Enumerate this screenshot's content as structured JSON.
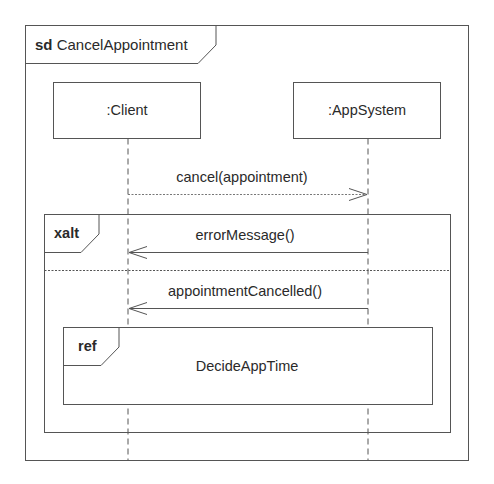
{
  "diagram": {
    "type": "UML sequence diagram",
    "frame": {
      "keyword": "sd",
      "name": "CancelAppointment"
    },
    "lifelines": [
      {
        "label": ":Client"
      },
      {
        "label": ":AppSystem"
      }
    ],
    "messages": [
      {
        "label": "cancel(appointment)",
        "from": ":Client",
        "to": ":AppSystem",
        "style": "dotted"
      },
      {
        "label": "errorMessage()",
        "from": ":AppSystem",
        "to": ":Client",
        "style": "solid"
      },
      {
        "label": "appointmentCancelled()",
        "from": ":AppSystem",
        "to": ":Client",
        "style": "solid"
      }
    ],
    "fragments": {
      "alt": {
        "operator": "xalt"
      },
      "ref": {
        "operator": "ref",
        "name": "DecideAppTime"
      }
    },
    "colors": {
      "line": "#555555",
      "text": "#2a2a2a",
      "background": "#ffffff"
    }
  }
}
